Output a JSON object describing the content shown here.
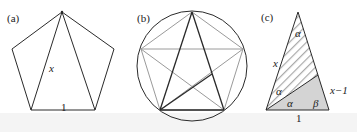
{
  "panels": {
    "a": {
      "label": "(a)",
      "diagonal_label": "x",
      "side_label": "1"
    },
    "b": {
      "label": "(b)"
    },
    "c": {
      "label": "(c)",
      "side_left_label": "x",
      "side_right_label": "x−1",
      "base_label": "1",
      "angle_top": "α",
      "angle_left_upper": "α",
      "angle_left_lower": "α",
      "angle_right": "β"
    }
  },
  "colors": {
    "stroke_dark": "#2a2a2a",
    "stroke_gray": "#9a9a9a",
    "fill_gray": "#d4d4d4",
    "hatch": "#a8a8a8"
  }
}
